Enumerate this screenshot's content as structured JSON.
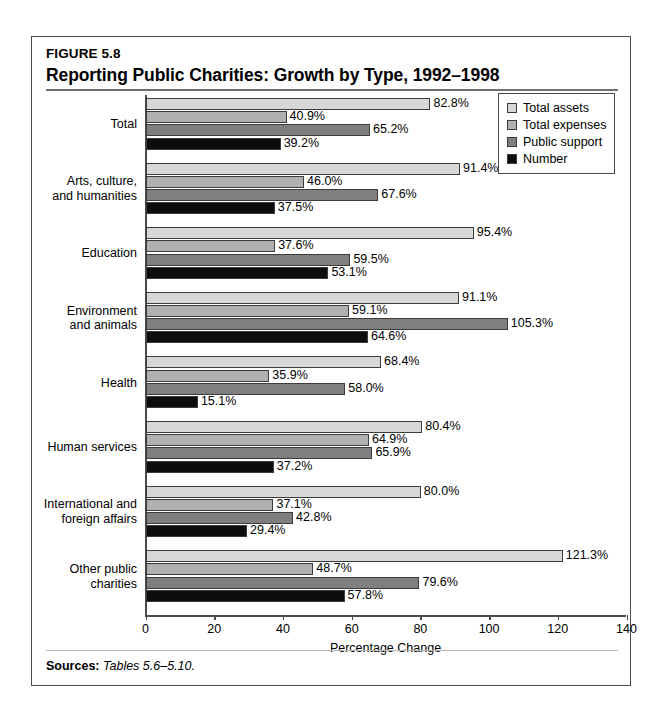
{
  "figure": {
    "number": "FIGURE 5.8",
    "title": "Reporting Public Charities: Growth by Type, 1992–1998",
    "sources_label": "Sources:",
    "sources_text": "Tables 5.6–5.10."
  },
  "chart_data": {
    "type": "bar",
    "orientation": "horizontal",
    "title": "Reporting Public Charities: Growth by Type, 1992–1998",
    "xlabel": "Percentage Change",
    "ylabel": "",
    "xlim": [
      0,
      140
    ],
    "xticks": [
      0,
      20,
      40,
      60,
      80,
      100,
      120,
      140
    ],
    "grid": false,
    "legend_position": "top-right",
    "value_suffix": "%",
    "categories": [
      "Total",
      "Arts, culture, and humanities",
      "Education",
      "Environment and animals",
      "Health",
      "Human services",
      "International and foreign affairs",
      "Other public charities"
    ],
    "series": [
      {
        "name": "Total assets",
        "color": "#d7d7d7",
        "values": [
          82.8,
          91.4,
          95.4,
          91.1,
          68.4,
          80.4,
          80.0,
          121.3
        ]
      },
      {
        "name": "Total expenses",
        "color": "#b0b0b0",
        "values": [
          40.9,
          46.0,
          37.6,
          59.1,
          35.9,
          64.9,
          37.1,
          48.7
        ]
      },
      {
        "name": "Public support",
        "color": "#7f7f7f",
        "values": [
          65.2,
          67.6,
          59.5,
          105.3,
          58.0,
          65.9,
          42.8,
          79.6
        ]
      },
      {
        "name": "Number",
        "color": "#0d0d0d",
        "values": [
          39.2,
          37.5,
          53.1,
          64.6,
          15.1,
          37.2,
          29.4,
          57.8
        ]
      }
    ]
  },
  "category_label_lines": [
    [
      "Total"
    ],
    [
      "Arts, culture,",
      "and humanities"
    ],
    [
      "Education"
    ],
    [
      "Environment",
      "and animals"
    ],
    [
      "Health"
    ],
    [
      "Human services"
    ],
    [
      "International and",
      "foreign affairs"
    ],
    [
      "Other public",
      "charities"
    ]
  ],
  "value_labels": [
    [
      "82.8%",
      "40.9%",
      "65.2%",
      "39.2%"
    ],
    [
      "91.4%",
      "46.0%",
      "67.6%",
      "37.5%"
    ],
    [
      "95.4%",
      "37.6%",
      "59.5%",
      "53.1%"
    ],
    [
      "91.1%",
      "59.1%",
      "105.3%",
      "64.6%"
    ],
    [
      "68.4%",
      "35.9%",
      "58.0%",
      "15.1%"
    ],
    [
      "80.4%",
      "64.9%",
      "65.9%",
      "37.2%"
    ],
    [
      "80.0%",
      "37.1%",
      "42.8%",
      "29.4%"
    ],
    [
      "121.3%",
      "48.7%",
      "79.6%",
      "57.8%"
    ]
  ],
  "axis": {
    "tick_labels": [
      "0",
      "20",
      "40",
      "60",
      "80",
      "100",
      "120",
      "140"
    ],
    "title": "Percentage Change"
  },
  "legend": {
    "items": [
      {
        "label": "Total assets",
        "color": "#d7d7d7"
      },
      {
        "label": "Total expenses",
        "color": "#b0b0b0"
      },
      {
        "label": "Public support",
        "color": "#7f7f7f"
      },
      {
        "label": "Number",
        "color": "#0d0d0d"
      }
    ]
  }
}
